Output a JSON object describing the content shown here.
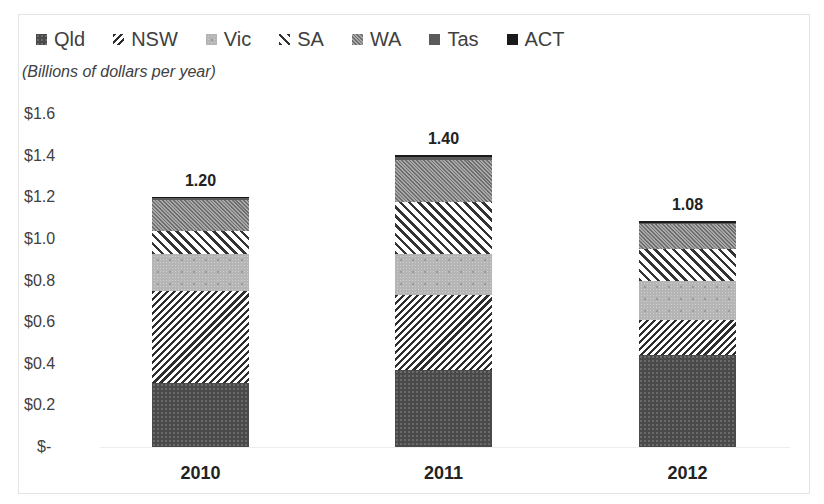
{
  "chart_data": {
    "type": "bar",
    "stacked": true,
    "title": "",
    "subtitle": "(Billions of dollars per year)",
    "xlabel": "",
    "ylabel": "",
    "ylim": [
      0,
      1.6
    ],
    "grid": false,
    "legend_position": "top",
    "categories": [
      "2010",
      "2011",
      "2012"
    ],
    "y_ticks": [
      "$-",
      "$0.2",
      "$0.4",
      "$0.6",
      "$0.8",
      "$1.0",
      "$1.2",
      "$1.4",
      "$1.6"
    ],
    "y_tick_values": [
      0,
      0.2,
      0.4,
      0.6,
      0.8,
      1.0,
      1.2,
      1.4,
      1.6
    ],
    "series": [
      {
        "name": "Qld",
        "pattern": "dark-dotted",
        "values": [
          0.31,
          0.37,
          0.44
        ]
      },
      {
        "name": "NSW",
        "pattern": "wide-diagonal",
        "values": [
          0.44,
          0.36,
          0.17
        ]
      },
      {
        "name": "Vic",
        "pattern": "light-dotted-grid",
        "values": [
          0.18,
          0.2,
          0.19
        ]
      },
      {
        "name": "SA",
        "pattern": "light-diagonal",
        "values": [
          0.11,
          0.25,
          0.15
        ]
      },
      {
        "name": "WA",
        "pattern": "dense-diagonal",
        "values": [
          0.15,
          0.2,
          0.12
        ]
      },
      {
        "name": "Tas",
        "pattern": "solid-grey",
        "values": [
          0.007,
          0.015,
          0.008
        ]
      },
      {
        "name": "ACT",
        "pattern": "solid-black",
        "values": [
          0.005,
          0.01,
          0.007
        ]
      }
    ],
    "totals": [
      1.2,
      1.4,
      1.08
    ],
    "total_labels": [
      "1.20",
      "1.40",
      "1.08"
    ]
  },
  "legend": {
    "items": [
      {
        "label": "Qld",
        "cls": "p-qld"
      },
      {
        "label": "NSW",
        "cls": "p-nsw"
      },
      {
        "label": "Vic",
        "cls": "p-vic"
      },
      {
        "label": "SA",
        "cls": "p-sa"
      },
      {
        "label": "WA",
        "cls": "p-wa"
      },
      {
        "label": "Tas",
        "cls": "p-tas"
      },
      {
        "label": "ACT",
        "cls": "p-act"
      }
    ]
  },
  "layout": {
    "plot_bottom_y": 447,
    "px_per_unit": 208,
    "bar_left_x": [
      152,
      395,
      639
    ]
  }
}
